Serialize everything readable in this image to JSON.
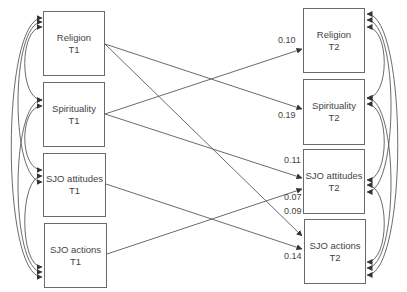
{
  "nodes": {
    "religion_t1": {
      "name": "Religion",
      "time": "T1"
    },
    "spirituality_t1": {
      "name": "Spirituality",
      "time": "T1"
    },
    "sjo_attitudes_t1": {
      "name": "SJO attitudes",
      "time": "T1"
    },
    "sjo_actions_t1": {
      "name": "SJO actions",
      "time": "T1"
    },
    "religion_t2": {
      "name": "Religion",
      "time": "T2"
    },
    "spirituality_t2": {
      "name": "Spirituality",
      "time": "T2"
    },
    "sjo_attitudes_t2": {
      "name": "SJO attitudes",
      "time": "T2"
    },
    "sjo_actions_t2": {
      "name": "SJO actions",
      "time": "T2"
    }
  },
  "paths": [
    {
      "from": "spirituality_t1",
      "to": "religion_t2",
      "coefficient": "0.10"
    },
    {
      "from": "religion_t1",
      "to": "spirituality_t2",
      "coefficient": "0.19"
    },
    {
      "from": "spirituality_t1",
      "to": "sjo_attitudes_t2",
      "coefficient": "0.11"
    },
    {
      "from": "sjo_actions_t1",
      "to": "sjo_attitudes_t2",
      "coefficient": "0.07"
    },
    {
      "from": "religion_t1",
      "to": "sjo_actions_t2",
      "coefficient": "0.09"
    },
    {
      "from": "sjo_attitudes_t1",
      "to": "sjo_actions_t2",
      "coefficient": "0.14"
    }
  ],
  "correlations": {
    "t1": [
      [
        "religion_t1",
        "spirituality_t1"
      ],
      [
        "religion_t1",
        "sjo_attitudes_t1"
      ],
      [
        "religion_t1",
        "sjo_actions_t1"
      ],
      [
        "spirituality_t1",
        "sjo_attitudes_t1"
      ],
      [
        "spirituality_t1",
        "sjo_actions_t1"
      ],
      [
        "sjo_attitudes_t1",
        "sjo_actions_t1"
      ]
    ],
    "t2": [
      [
        "religion_t2",
        "spirituality_t2"
      ],
      [
        "religion_t2",
        "sjo_attitudes_t2"
      ],
      [
        "religion_t2",
        "sjo_actions_t2"
      ],
      [
        "spirituality_t2",
        "sjo_attitudes_t2"
      ],
      [
        "spirituality_t2",
        "sjo_actions_t2"
      ],
      [
        "sjo_attitudes_t2",
        "sjo_actions_t2"
      ]
    ]
  },
  "colors": {
    "line": "#5a5a5a",
    "text": "#444444"
  }
}
